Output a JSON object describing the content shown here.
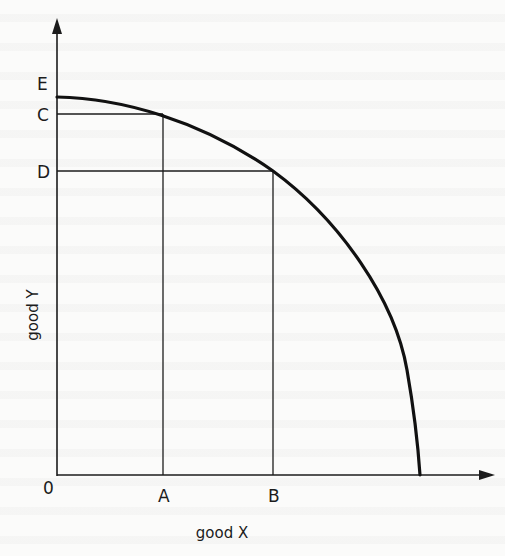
{
  "diagram": {
    "type": "production-possibility-frontier",
    "axes": {
      "x_label": "good X",
      "y_label": "good Y",
      "origin_label": "0"
    },
    "points": {
      "x_axis": [
        {
          "label": "A"
        },
        {
          "label": "B"
        }
      ],
      "y_axis": [
        {
          "label": "E"
        },
        {
          "label": "C"
        },
        {
          "label": "D"
        }
      ]
    },
    "colors": {
      "ink": "#1c1c1c",
      "paper": "#fbfbfa"
    }
  }
}
